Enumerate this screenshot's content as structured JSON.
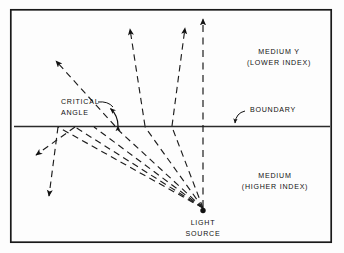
{
  "figure": {
    "frame": {
      "x": 10,
      "y": 9,
      "width": 322,
      "height": 234,
      "stroke": "#1a1a1a",
      "stroke_width": 1.6
    },
    "background_color": "#fdfdfd",
    "ink_color": "#111111"
  },
  "labels": {
    "medium_upper_line1": "MEDIUM Y",
    "medium_upper_line2": "(LOWER INDEX)",
    "medium_lower_line1": "MEDIUM",
    "medium_lower_line2": "(HIGHER INDEX)",
    "critical_angle_line1": "CRITICAL",
    "critical_angle_line2": "ANGLE",
    "boundary": "BOUNDARY",
    "light_source_line1": "LIGHT",
    "light_source_line2": "SOURCE"
  },
  "geometry": {
    "boundary_line": {
      "x1": 14,
      "y1": 126.5,
      "x2": 330,
      "y2": 126.5,
      "stroke_width": 1.2
    },
    "light_source": {
      "x": 203,
      "y": 211,
      "dot_radius": 2.6
    },
    "normal_ray": {
      "from_x": 203,
      "from_y": 209,
      "to_x": 203,
      "to_y": 17,
      "style": "dashed",
      "label": "perpendicular-ray"
    },
    "incident_rays": [
      {
        "name": "ray-1-steep",
        "hit_x": 172,
        "hit_y": 126.5
      },
      {
        "name": "ray-2",
        "hit_x": 145,
        "hit_y": 126.5
      },
      {
        "name": "ray-3",
        "hit_x": 115,
        "hit_y": 126.5
      },
      {
        "name": "ray-4-critical",
        "hit_x": 94,
        "hit_y": 126.5
      },
      {
        "name": "ray-5-reflected",
        "hit_x": 75,
        "hit_y": 126.5
      },
      {
        "name": "ray-6-reflected",
        "hit_x": 58,
        "hit_y": 126.5
      }
    ],
    "refracted_rays": [
      {
        "name": "refracted-ray-near-normal",
        "from_x": 172,
        "from_y": 126.5,
        "to_x": 200,
        "to_y": 18
      },
      {
        "name": "refracted-ray-mid",
        "from_x": 145,
        "from_y": 126.5,
        "to_x": 130,
        "to_y": 20
      },
      {
        "name": "refracted-ray-grazing",
        "from_x": 115,
        "from_y": 126.5,
        "to_x": 52,
        "to_y": 58
      }
    ],
    "reflected_rays": [
      {
        "name": "reflected-ray-1",
        "from_x": 75,
        "from_y": 126.5,
        "to_x": 32,
        "to_y": 158
      },
      {
        "name": "reflected-ray-2",
        "from_x": 58,
        "from_y": 126.5,
        "to_x": 46,
        "to_y": 200
      }
    ],
    "critical_angle_arc": {
      "cx": 94,
      "cy": 126.5,
      "radius": 24,
      "start_deg": 180,
      "end_deg": 130
    },
    "boundary_pointer": {
      "from_x": 243,
      "from_y": 112,
      "to_x": 236,
      "to_y": 124
    },
    "critical_pointer": {
      "from_x": 96,
      "from_y": 104,
      "to_x": 106,
      "to_y": 111
    }
  },
  "label_positions": {
    "medium_upper": {
      "x": 278,
      "y": 54
    },
    "medium_lower": {
      "x": 272,
      "y": 178
    },
    "critical_angle": {
      "x": 62,
      "y": 106
    },
    "boundary": {
      "x": 248,
      "y": 112
    },
    "light_source": {
      "x": 203,
      "y": 225
    }
  }
}
